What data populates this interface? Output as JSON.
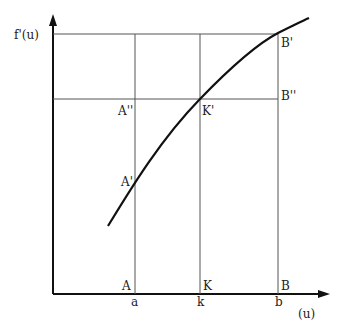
{
  "diagram": {
    "y_axis_label": "f'(u)",
    "x_axis_label": "(u)",
    "x_ticks": [
      {
        "label": "a",
        "x": 135
      },
      {
        "label": "k",
        "x": 200
      },
      {
        "label": "b",
        "x": 278
      }
    ],
    "points": {
      "A": "A",
      "K": "K",
      "B": "B",
      "A_prime": "A'",
      "K_prime": "K'",
      "B_prime": "B'",
      "A_double": "A''",
      "B_double": "B''"
    },
    "colors": {
      "axis": "#111111",
      "grid": "#555555",
      "curve": "#111111"
    }
  }
}
